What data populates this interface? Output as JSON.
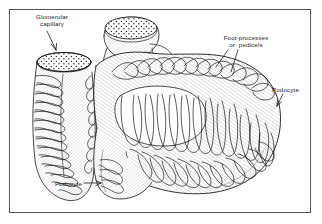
{
  "figure": {
    "kind": "biological-line-drawing",
    "background_color": "#ffffff",
    "ink_color": "#1a1a1a",
    "frame_color": "#56565a",
    "frame": {
      "x": 9,
      "y": 9,
      "width": 302,
      "height": 204
    }
  },
  "labels": [
    {
      "id": "glomerular-capillary",
      "line1": "Glomerular",
      "line2": "capillary",
      "align": "center",
      "leader": "arrow-down"
    },
    {
      "id": "foot-processes",
      "line1": "Foot-processes",
      "line2": "or  pedicels",
      "align": "center",
      "leader": "two-lines-down-left"
    },
    {
      "id": "podocyte-right",
      "line1": "Podocyte",
      "line2": "",
      "align": "left",
      "leader": "arrow-down-left"
    },
    {
      "id": "podocyte-bottom",
      "line1": "Podocyte",
      "line2": "",
      "align": "left",
      "leader": "arrow-right"
    }
  ]
}
